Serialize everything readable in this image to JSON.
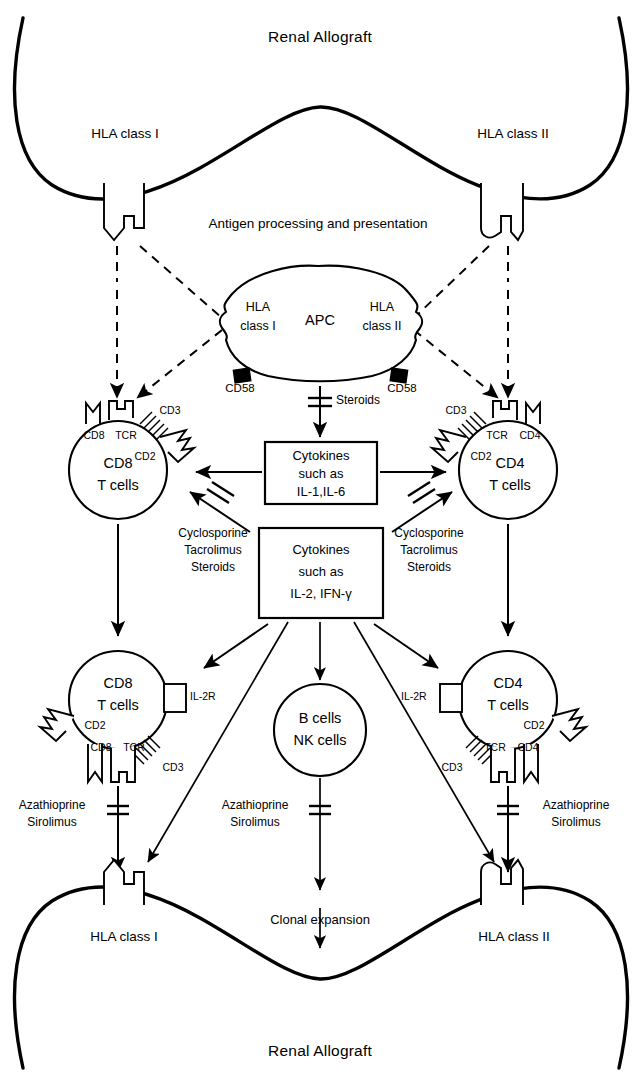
{
  "figure": {
    "title_top": "Renal Allograft",
    "title_bottom": "Renal Allograft",
    "antigen_label": "Antigen processing and presentation",
    "clonal_label": "Clonal expansion"
  },
  "graft_top": {
    "hla_left": "HLA class I",
    "hla_right": "HLA class II"
  },
  "graft_bottom": {
    "hla_left": "HLA class I",
    "hla_right": "HLA class II"
  },
  "apc": {
    "name": "APC",
    "hla_left_line1": "HLA",
    "hla_left_line2": "class I",
    "hla_right_line1": "HLA",
    "hla_right_line2": "class II",
    "cd58_left": "CD58",
    "cd58_right": "CD58"
  },
  "cells": {
    "cd8_upper": {
      "name_line1": "CD8",
      "name_line2": "T cells",
      "receptors": {
        "cd8": "CD8",
        "tcr": "TCR",
        "cd3": "CD3",
        "cd2": "CD2"
      }
    },
    "cd4_upper": {
      "name_line1": "CD4",
      "name_line2": "T cells",
      "receptors": {
        "tcr": "TCR",
        "cd4": "CD4",
        "cd3": "CD3",
        "cd2": "CD2"
      }
    },
    "cd8_lower": {
      "name_line1": "CD8",
      "name_line2": "T cells",
      "receptors": {
        "il2r": "IL-2R",
        "cd2": "CD2",
        "cd8": "CD8",
        "tcr": "TCR",
        "cd3": "CD3"
      }
    },
    "cd4_lower": {
      "name_line1": "CD4",
      "name_line2": "T cells",
      "receptors": {
        "il2r": "IL-2R",
        "cd2": "CD2",
        "tcr": "TCR",
        "cd4": "CD4",
        "cd3": "CD3"
      }
    },
    "b_nk": {
      "name_line1": "B cells",
      "name_line2": "NK cells"
    }
  },
  "boxes": {
    "cytokines_upper": {
      "line1": "Cytokines",
      "line2": "such as",
      "line3": "IL-1,IL-6"
    },
    "cytokines_lower": {
      "line1": "Cytokines",
      "line2": "such as",
      "line3": "IL-2, IFN-γ"
    }
  },
  "drugs": {
    "steroids_apc": "Steroids",
    "left_block": {
      "line1": "Cyclosporine",
      "line2": "Tacrolimus",
      "line3": "Steroids"
    },
    "right_block": {
      "line1": "Cyclosporine",
      "line2": "Tacrolimus",
      "line3": "Steroids"
    },
    "aza_left": {
      "line1": "Azathioprine",
      "line2": "Sirolimus"
    },
    "aza_center": {
      "line1": "Azathioprine",
      "line2": "Sirolimus"
    },
    "aza_right": {
      "line1": "Azathioprine",
      "line2": "Sirolimus"
    }
  },
  "colors": {
    "ink": "#000000",
    "paper": "#ffffff"
  }
}
